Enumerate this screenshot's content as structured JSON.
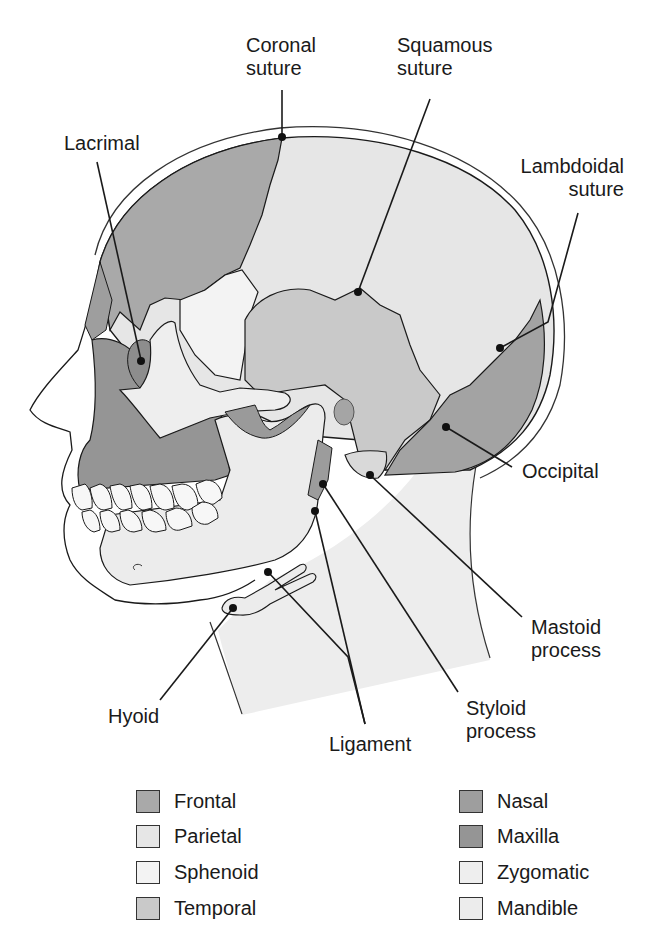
{
  "figure": {
    "labels": {
      "coronal_suture": [
        "Coronal",
        "suture"
      ],
      "squamous_suture": [
        "Squamous",
        "suture"
      ],
      "lacrimal": [
        "Lacrimal"
      ],
      "lambdoidal_suture": [
        "Lambdoidal",
        "suture"
      ],
      "occipital": [
        "Occipital"
      ],
      "mastoid_process": [
        "Mastoid",
        "process"
      ],
      "styloid_process": [
        "Styloid",
        "process"
      ],
      "ligament": [
        "Ligament"
      ],
      "hyoid": [
        "Hyoid"
      ]
    }
  },
  "legend": {
    "items": [
      {
        "label": "Frontal",
        "color": "#a9a9a9"
      },
      {
        "label": "Parietal",
        "color": "#e6e6e6"
      },
      {
        "label": "Sphenoid",
        "color": "#f3f3f3"
      },
      {
        "label": "Temporal",
        "color": "#c9c9c9"
      },
      {
        "label": "Nasal",
        "color": "#9e9e9e"
      },
      {
        "label": "Maxilla",
        "color": "#959595"
      },
      {
        "label": "Zygomatic",
        "color": "#eeeeee"
      },
      {
        "label": "Mandible",
        "color": "#ececec"
      }
    ]
  },
  "colors": {
    "frontal": "#a9a9a9",
    "parietal": "#e6e6e6",
    "sphenoid": "#f3f3f3",
    "temporal": "#c9c9c9",
    "nasal": "#9e9e9e",
    "maxilla": "#959595",
    "zygomatic": "#eeeeee",
    "mandible": "#ececec",
    "occipital": "#a3a3a3",
    "skin": "#ededed",
    "outline": "#1a1a1a"
  }
}
